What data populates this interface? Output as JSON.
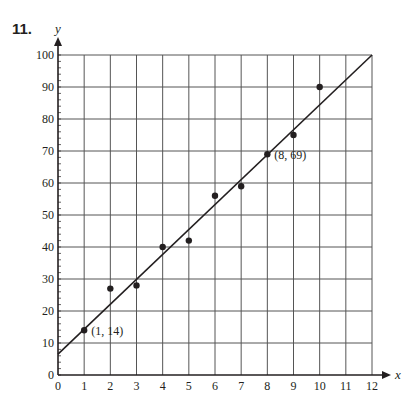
{
  "problem": {
    "number": "11."
  },
  "chart_data": {
    "type": "scatter",
    "title": "",
    "xlabel": "x",
    "ylabel": "y",
    "xlim": [
      0,
      12
    ],
    "ylim": [
      0,
      100
    ],
    "grid": true,
    "x_ticks": [
      "0",
      "1",
      "2",
      "3",
      "4",
      "5",
      "6",
      "7",
      "8",
      "9",
      "10",
      "11",
      "12"
    ],
    "y_ticks": [
      "0",
      "10",
      "20",
      "30",
      "40",
      "50",
      "60",
      "70",
      "80",
      "90",
      "100"
    ],
    "series": [
      {
        "name": "data",
        "type": "scatter",
        "x": [
          1,
          2,
          3,
          4,
          5,
          6,
          7,
          8,
          9,
          10
        ],
        "y": [
          14,
          27,
          28,
          40,
          42,
          56,
          59,
          69,
          75,
          90
        ]
      },
      {
        "name": "line of fit",
        "type": "line",
        "x": [
          0,
          12
        ],
        "y": [
          6.5,
          100
        ]
      }
    ],
    "annotations": [
      {
        "text": "(1, 14)",
        "x": 1,
        "y": 14
      },
      {
        "text": "(8, 69)",
        "x": 8,
        "y": 69
      }
    ]
  },
  "colors": {
    "ink": "#231f20",
    "grid": "#555555"
  }
}
